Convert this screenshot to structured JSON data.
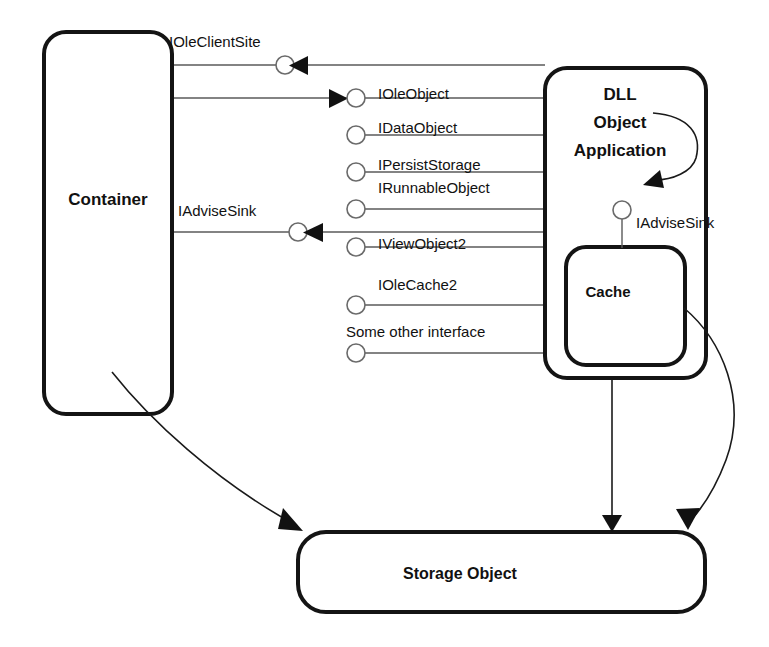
{
  "diagram": {
    "colors": {
      "box_stroke": "#141414",
      "connector": "#5a5a5a",
      "curve": "#1a1a1a",
      "arrow_fill": "#111111",
      "background": "#ffffff"
    },
    "boxes": {
      "container": {
        "label": "Container"
      },
      "dll_app": {
        "line1": "DLL",
        "line2": "Object",
        "line3": "Application"
      },
      "cache": {
        "label": "Cache"
      },
      "storage": {
        "label": "Storage Object"
      }
    },
    "container_interfaces": [
      {
        "name": "IOleClientSite",
        "direction": "incoming"
      },
      {
        "name": "IAdviseSink",
        "direction": "incoming"
      }
    ],
    "object_interfaces": [
      {
        "name": "IOleObject",
        "direction": "incoming-from-container"
      },
      {
        "name": "IDataObject",
        "direction": "none"
      },
      {
        "name": "IPersistStorage",
        "direction": "none"
      },
      {
        "name": "IRunnableObject",
        "direction": "none"
      },
      {
        "name": "IViewObject2",
        "direction": "none"
      },
      {
        "name": "IOleCache2",
        "direction": "none"
      },
      {
        "name": "Some other interface",
        "direction": "none"
      }
    ],
    "cache_interface": {
      "name": "IAdviseSink"
    }
  }
}
